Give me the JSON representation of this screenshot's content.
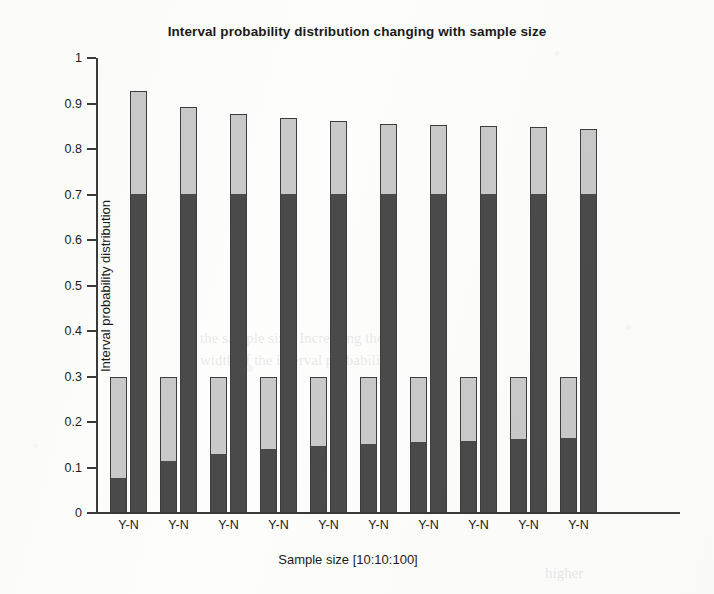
{
  "chart_data": {
    "type": "bar",
    "subtype": "grouped-stacked",
    "title": "Interval probability distribution changing with sample size",
    "xlabel": "Sample size [10:10:100]",
    "ylabel": "Interval probability distribution",
    "ylim": [
      0,
      1
    ],
    "yticks": [
      0,
      0.1,
      0.2,
      0.3,
      0.4,
      0.5,
      0.6,
      0.7,
      0.8,
      0.9,
      1
    ],
    "ytick_labels": [
      "0",
      "0.1",
      "0.2",
      "0.3",
      "0.4",
      "0.5",
      "0.6",
      "0.7",
      "0.8",
      "0.9",
      "1"
    ],
    "categories": [
      "Y-N",
      "Y-N",
      "Y-N",
      "Y-N",
      "Y-N",
      "Y-N",
      "Y-N",
      "Y-N",
      "Y-N",
      "Y-N"
    ],
    "sample_sizes": [
      10,
      20,
      30,
      40,
      50,
      60,
      70,
      80,
      90,
      100
    ],
    "grid": false,
    "legend": "none",
    "colors": {
      "dark_segment": "#4a4a4a",
      "light_segment": "#c9c9c9",
      "axis": "#3a3a3a",
      "background": "#fdfdfc"
    },
    "bars_per_group": 2,
    "bar_names": [
      "Y",
      "N"
    ],
    "series": [
      {
        "name": "Y bar - dark lower segment",
        "bar": "Y",
        "segment": "lower",
        "color": "#4a4a4a",
        "values": [
          0.075,
          0.112,
          0.127,
          0.138,
          0.145,
          0.15,
          0.154,
          0.157,
          0.161,
          0.163
        ]
      },
      {
        "name": "Y bar - light upper segment (top at 0.3)",
        "bar": "Y",
        "segment": "upper",
        "color": "#c9c9c9",
        "tops": [
          0.3,
          0.3,
          0.3,
          0.3,
          0.3,
          0.3,
          0.3,
          0.3,
          0.3,
          0.3
        ]
      },
      {
        "name": "N bar - dark lower segment (top at 0.7)",
        "bar": "N",
        "segment": "lower",
        "color": "#4a4a4a",
        "values": [
          0.7,
          0.7,
          0.7,
          0.7,
          0.7,
          0.7,
          0.7,
          0.7,
          0.7,
          0.7
        ]
      },
      {
        "name": "N bar - light upper segment",
        "bar": "N",
        "segment": "upper",
        "color": "#c9c9c9",
        "tops": [
          0.928,
          0.893,
          0.877,
          0.868,
          0.861,
          0.856,
          0.853,
          0.851,
          0.848,
          0.845
        ]
      }
    ]
  },
  "page_bleed": {
    "line1": "the sample size. Increasing the",
    "line2": "width of the interval probability",
    "line3": "higher"
  }
}
